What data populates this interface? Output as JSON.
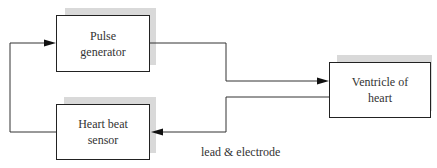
{
  "diagram": {
    "blocks": [
      {
        "id": "pulse",
        "label_line1": "Pulse",
        "label_line2": "generator"
      },
      {
        "id": "ventricle",
        "label_line1": "Ventricle of",
        "label_line2": "heart"
      },
      {
        "id": "sensor",
        "label_line1": "Heart beat",
        "label_line2": "sensor"
      }
    ],
    "edge_label": "lead & electrode",
    "colors": {
      "line": "#333333",
      "shadow": "#d9d9d9",
      "border": "#222222"
    }
  }
}
